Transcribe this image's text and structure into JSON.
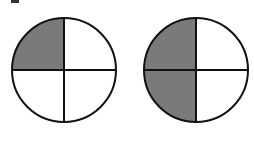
{
  "figure": {
    "shade_color": "#7a7a7a",
    "line_color": "#111111",
    "circles": [
      {
        "id": "left",
        "cx": 64,
        "cy": 70,
        "r": 52,
        "parts": 4,
        "shaded_quarters": [
          "top-left"
        ],
        "fraction": "1/4"
      },
      {
        "id": "right",
        "cx": 196,
        "cy": 70,
        "r": 52,
        "parts": 4,
        "shaded_quarters": [
          "top-left",
          "bottom-left"
        ],
        "fraction": "2/4"
      }
    ]
  }
}
